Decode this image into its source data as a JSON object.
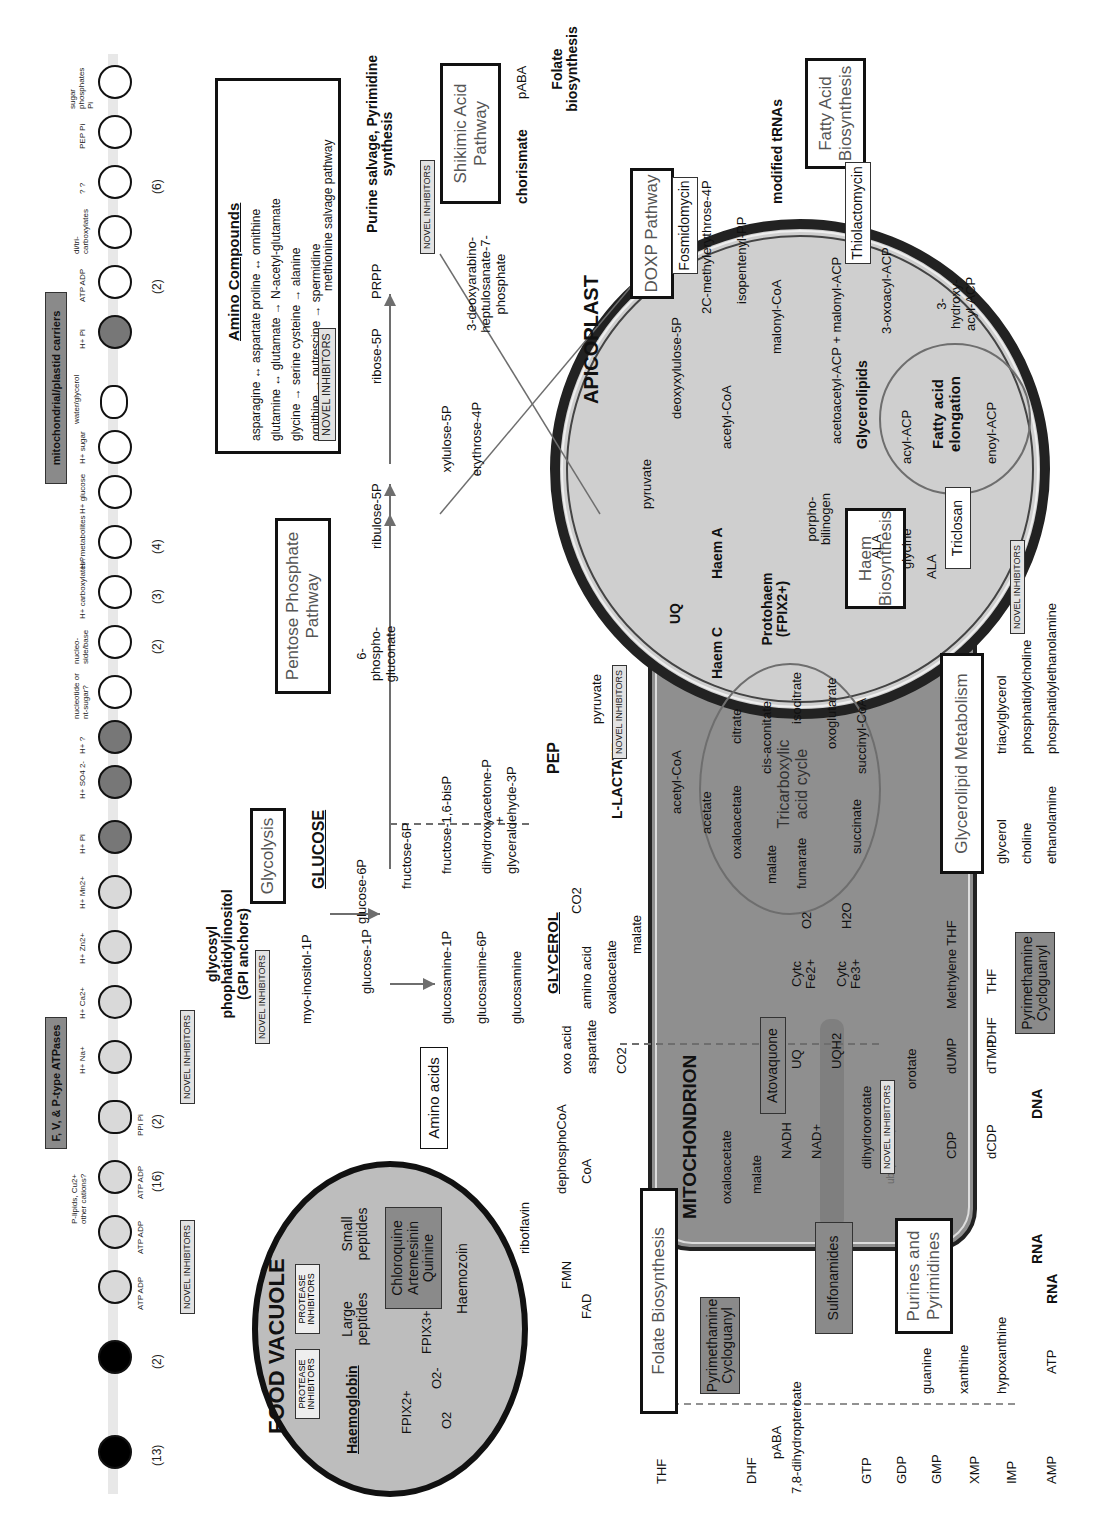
{
  "transporters": {
    "atpases_title": "F, V, & P-type ATPases",
    "carriers_title": "mitochondrial/plastid carriers",
    "abc_title": "ABC transporters",
    "abc_items": [
      {
        "label": "drugs?",
        "sub": "ATP ADP",
        "count": "(13)"
      },
      {
        "label": "H+ drugs?",
        "sub": "",
        "count": "(2)"
      }
    ],
    "atpase_items": [
      {
        "label": "H+",
        "glyph": "F ?",
        "sub": "ATP ADP",
        "count": ""
      },
      {
        "label": "H+",
        "glyph": "V",
        "sub": "ATP ADP",
        "count": ""
      },
      {
        "label": "P-lipids, Cu2+ other cations?",
        "glyph": "P",
        "sub": "ATP ADP",
        "count": "(16)"
      },
      {
        "label": "H+",
        "glyph": "",
        "sub": "PPi Pi",
        "count": "(2)"
      }
    ],
    "ion_items": [
      {
        "label": "H+ Na+"
      },
      {
        "label": "H+ Ca2+"
      },
      {
        "label": "H+ Zn2+"
      },
      {
        "label": "H+ Mn2+"
      },
      {
        "label": "H+ Pi"
      },
      {
        "label": "H+ SO4 2-"
      },
      {
        "label": "H+ ?"
      }
    ],
    "solute_items": [
      {
        "label": "nucleotide or nt-sugar?",
        "count": ""
      },
      {
        "label": "nucleo-side/base",
        "count": "(2)"
      },
      {
        "label": "H+ carboxylates?",
        "count": "(3)"
      },
      {
        "label": "H+ metabolites",
        "count": "(4)"
      },
      {
        "label": "H+ glucose",
        "count": ""
      },
      {
        "label": "H+ sugar",
        "count": ""
      },
      {
        "label": "water/glycerol",
        "count": ""
      }
    ],
    "carrier_items": [
      {
        "label": "H+ Pi",
        "count": ""
      },
      {
        "label": "ATP ADP",
        "count": "(2)"
      },
      {
        "label": "di/tri-carboxylates",
        "count": ""
      },
      {
        "label": "? ?",
        "count": "(6)"
      },
      {
        "label": "PEP Pi",
        "count": ""
      },
      {
        "label": "sugar phosphates Pi",
        "count": ""
      }
    ]
  },
  "inhibitors": {
    "novel": "NOVEL INHIBITORS",
    "protease": "PROTEASE INHIBITORS",
    "chloroquine": "Chloroquine Artemesinin Quinine",
    "fosmidomycin": "Fosmidomycin",
    "thiolactomycin": "Thiolactomycin",
    "triclosan": "Triclosan",
    "atovaquone": "Atovaquone",
    "pyrimethamine": "Pyrimethamine Cycloguanyl",
    "sulfonamides": "Sulfonamides"
  },
  "food_vacuole": {
    "title": "FOOD VACUOLE",
    "haemoglobin": "Haemoglobin",
    "large_peptides": "Large peptides",
    "small_peptides": "Small peptides",
    "fpix2": "FPIX2+",
    "fpix3": "FPIX3+",
    "o2": "O2",
    "o2minus": "O2-",
    "haemozoin": "Haemozoin"
  },
  "cytosol": {
    "amino_acids_box": "Amino acids",
    "gpi": "glycosyl phophatidylinositol (GPI anchors)",
    "myo_inositol": "myo-inositol-1P",
    "glycolysis_box": "Glycolysis",
    "glucose": "GLUCOSE",
    "glucose6p": "glucose-6P",
    "glucose1p": "glucose-1P",
    "fructose6p": "fructose-6P",
    "fructose16": "fructose-1,6-bisP",
    "dhap": "dihydroxyacetone-P",
    "plus": "+",
    "g3p": "glyceraldehyde-3P",
    "pep": "PEP",
    "pyruvate": "pyruvate",
    "l_lactate": "L-LACTATE",
    "glucosamine1p": "glucosamine-1P",
    "glucosamine6p": "glucosamine-6P",
    "glucosamine": "glucosamine",
    "glycerol": "GLYCEROL",
    "co2": "CO2",
    "oxaloacetate": "oxaloacetate",
    "malate": "malate",
    "amino_acid": "amino acid",
    "oxo_acid": "oxo acid",
    "aspartate": "aspartate",
    "riboflavin": "riboflavin",
    "fmn": "FMN",
    "fad": "FAD",
    "dephosphocoa": "dephosphoCoA",
    "coa": "CoA"
  },
  "ppp": {
    "box": "Pentose Phosphate Pathway",
    "phosphogluconate": "6-phospho-gluconate",
    "ribulose5p": "ribulose-5P",
    "ribose5p": "ribose-5P",
    "prpp": "PRPP",
    "purine": "Purine salvage, Pyrimidine synthesis",
    "xylulose": "xylulose-5P",
    "erythrose": "erythrose-4P",
    "dahp": "3-deoxyarabino-heptulosanate-7-phosphate"
  },
  "amino_compounds": {
    "title": "Amino Compounds",
    "rows": [
      "asparagine ↔ aspartate   proline ↔ ornithine",
      "glutamine ↔ glutamate → N-acetyl-glutamate",
      "glycine → serine   cysteine → alanine",
      "ornithine → putrescine → spermidine"
    ],
    "salvage": "methionine salvage pathway"
  },
  "shikimate": {
    "box": "Shikimic Acid Pathway",
    "chorismate": "chorismate",
    "paba": "pABA",
    "folate": "Folate biosynthesis"
  },
  "apicoplast": {
    "title": "APICOPLAST",
    "doxp_box": "DOXP Pathway",
    "fa_box": "Fatty Acid Biosynthesis",
    "pyruvate": "pyruvate",
    "deoxyxylulose": "deoxyxylulose-5P",
    "methylerythrose": "2C-methylerythrose-4P",
    "isopentenyl": "isopentenyl-PP",
    "trnas": "modified tRNAs",
    "acetyl_coa": "acetyl-CoA",
    "malonyl_coa": "malonyl-CoA",
    "acetoacetyl": "acetoacetyl-ACP + malonyl-ACP",
    "glycerolipids": "Glycerolipids",
    "oxoacyl": "3-oxoacyl-ACP",
    "hydroxyacyl": "3-hydroxy-acyl-ACP",
    "acyl": "acyl-ACP",
    "enoyl": "enoyl-ACP",
    "elongation": "Fatty acid elongation",
    "porphobilinogen": "porpho-bilinogen",
    "ala": "ALA"
  },
  "mitochondrion": {
    "title": "MITOCHONDRION",
    "haem_box": "Haem Biosynthesis",
    "uq": "UQ",
    "haem_c": "Haem C",
    "haem_a": "Haem A",
    "protohaem": "Protohaem (FPIX2+)",
    "acetyl_coa": "acetyl-CoA",
    "acetate": "acetate",
    "tca": "Tricarboxylic acid cycle",
    "tca_nodes": [
      "oxaloacetate",
      "citrate",
      "cis-aconitate",
      "isocitrate",
      "oxoglutarate",
      "succinyl-CoA",
      "succinate",
      "fumarate",
      "malate"
    ],
    "glycine": "glycine",
    "ala": "ALA",
    "oxaloacetate": "oxaloacetate",
    "malate": "malate",
    "nadh": "NADH",
    "nad": "NAD+",
    "or": "or",
    "uq2": "UQ",
    "uqh2": "UQH2",
    "cytc2": "Cytc Fe2+",
    "cytc3": "Cytc Fe3+",
    "o2": "O2",
    "h2o": "H2O",
    "pool": "ubiquinone pool"
  },
  "glycerolipid": {
    "box": "Glycerolipid Metabolism",
    "rows": [
      {
        "from": "glycerol",
        "to": "triacylglycerol"
      },
      {
        "from": "choline",
        "to": "phosphatidylcholine"
      },
      {
        "from": "ethanolamine",
        "to": "phosphatidylethanolamine"
      }
    ]
  },
  "pyrimidine": {
    "dihydroorotate": "dihydroorotate",
    "orotate": "orotate",
    "dump": "dUMP",
    "dtmp": "dTMP",
    "cdp": "CDP",
    "dcdp": "dCDP",
    "dna": "DNA",
    "rna": "RNA",
    "methylene_thf": "Methylene THF",
    "dhf": "DHF",
    "thf": "THF"
  },
  "folate": {
    "box": "Folate Biosynthesis",
    "purines_box": "Purines and Pyrimidines",
    "thf": "THF",
    "dhf": "DHF",
    "paba": "pABA",
    "dihydropteroate": "7,8-dihydropteroate",
    "chain": [
      "GTP",
      "GDP",
      "GMP",
      "XMP",
      "IMP",
      "AMP"
    ],
    "guanine": "guanine",
    "xanthine": "xanthine",
    "hypoxanthine": "hypoxanthine",
    "atp": "ATP",
    "rna": "RNA"
  },
  "colors": {
    "vacuole_fill": "#bdbdbd",
    "mito_fill": "#8f8f8f",
    "apico_fill": "#cfcfcf",
    "drug_fill": "#8a8a8a",
    "arrow": "#6e6e6e"
  }
}
